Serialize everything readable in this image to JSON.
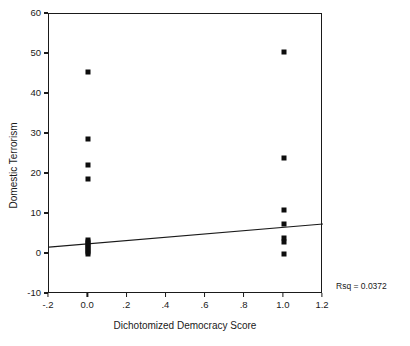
{
  "chart_data": {
    "type": "scatter",
    "title": "",
    "xlabel": "Dichotomized Democracy Score",
    "ylabel": "Domestic Terrorism",
    "xlim": [
      -0.2,
      1.2
    ],
    "ylim": [
      -10,
      60
    ],
    "grid": false,
    "legend": "none",
    "xticks": [
      -0.2,
      0.0,
      0.2,
      0.4,
      0.6,
      0.8,
      1.0,
      1.2
    ],
    "xticklabels": [
      "-.2",
      "0.0",
      ".2",
      ".4",
      ".6",
      ".8",
      "1.0",
      "1.2"
    ],
    "yticks": [
      -10,
      0,
      10,
      20,
      30,
      40,
      50,
      60
    ],
    "yticklabels": [
      "-10",
      "0",
      "10",
      "20",
      "30",
      "40",
      "50",
      "60"
    ],
    "marker": "square",
    "marker_color": "#0d0d0d",
    "points": [
      {
        "x": 0.0,
        "y": 45.5
      },
      {
        "x": 0.0,
        "y": 28.7
      },
      {
        "x": 0.0,
        "y": 22.2
      },
      {
        "x": 0.0,
        "y": 18.8
      },
      {
        "x": 0.0,
        "y": 3.5
      },
      {
        "x": 0.0,
        "y": 3.0
      },
      {
        "x": 0.0,
        "y": 2.5
      },
      {
        "x": 0.0,
        "y": 2.0
      },
      {
        "x": 0.0,
        "y": 1.5
      },
      {
        "x": 0.0,
        "y": 1.0
      },
      {
        "x": 0.0,
        "y": 0.5
      },
      {
        "x": 0.0,
        "y": 0.0
      },
      {
        "x": 1.0,
        "y": 50.5
      },
      {
        "x": 1.0,
        "y": 24.0
      },
      {
        "x": 1.0,
        "y": 11.0
      },
      {
        "x": 1.0,
        "y": 7.5
      },
      {
        "x": 1.0,
        "y": 4.0
      },
      {
        "x": 1.0,
        "y": 3.0
      },
      {
        "x": 1.0,
        "y": 0.0
      }
    ],
    "fit_line": {
      "x0": -0.2,
      "y0": 1.7,
      "x1": 1.2,
      "y1": 7.5
    },
    "annotation": {
      "text": "Rsq = 0.0372",
      "rsq_value": 0.0372
    }
  },
  "axes": {
    "y_title": "Domestic Terrorism",
    "x_title": "Dichotomized Democracy Score"
  }
}
